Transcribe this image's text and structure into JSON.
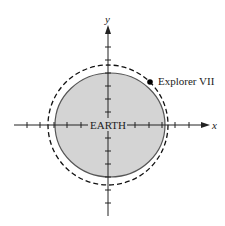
{
  "diagram": {
    "axes": {
      "x_label": "x",
      "y_label": "y",
      "tick_count_each_side": 7
    },
    "earth": {
      "label": "EARTH",
      "fill_color": "#d4d4d4",
      "stroke_color": "#555555"
    },
    "orbit": {
      "style": "dashed",
      "stroke_color": "#111111"
    },
    "satellite": {
      "label": "Explorer VII",
      "marker_color": "#000000"
    }
  }
}
